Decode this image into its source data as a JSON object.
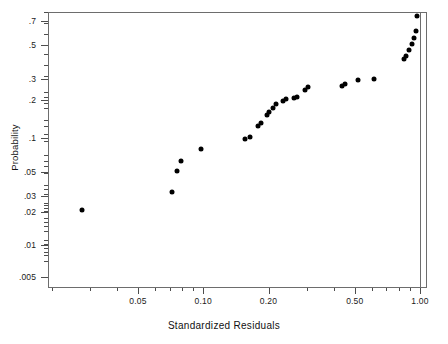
{
  "chart_data": {
    "type": "scatter",
    "title": "",
    "xlabel": "Standardized Residuals",
    "ylabel": "Probability",
    "xscale": "log",
    "yscale": "probability-log",
    "xlim": [
      0.004,
      1.08
    ],
    "ylim": [
      0.004,
      0.78
    ],
    "grid": false,
    "legend": null,
    "x_tick_labels": [
      "0.05",
      "0.10",
      "0.20",
      "0.50",
      "1.00"
    ],
    "x_tick_values": [
      0.05,
      0.1,
      0.2,
      0.5,
      1.0
    ],
    "y_tick_labels": [
      ".7",
      ".5",
      ".3",
      ".2",
      ".1",
      ".05",
      ".03",
      ".02",
      ".01",
      ".005"
    ],
    "y_tick_values": [
      0.7,
      0.5,
      0.3,
      0.2,
      0.1,
      0.05,
      0.03,
      0.02,
      0.01,
      0.005
    ],
    "points": [
      {
        "x": 0.0062,
        "y": 0.0079
      },
      {
        "x": 0.0275,
        "y": 0.0225
      },
      {
        "x": 0.0715,
        "y": 0.0375
      },
      {
        "x": 0.076,
        "y": 0.063
      },
      {
        "x": 0.0785,
        "y": 0.079
      },
      {
        "x": 0.098,
        "y": 0.103
      },
      {
        "x": 0.156,
        "y": 0.125
      },
      {
        "x": 0.164,
        "y": 0.132
      },
      {
        "x": 0.179,
        "y": 0.16
      },
      {
        "x": 0.185,
        "y": 0.17
      },
      {
        "x": 0.196,
        "y": 0.195
      },
      {
        "x": 0.202,
        "y": 0.205
      },
      {
        "x": 0.209,
        "y": 0.22
      },
      {
        "x": 0.217,
        "y": 0.235
      },
      {
        "x": 0.234,
        "y": 0.245
      },
      {
        "x": 0.242,
        "y": 0.252
      },
      {
        "x": 0.262,
        "y": 0.256
      },
      {
        "x": 0.27,
        "y": 0.262
      },
      {
        "x": 0.295,
        "y": 0.29
      },
      {
        "x": 0.305,
        "y": 0.3
      },
      {
        "x": 0.435,
        "y": 0.305
      },
      {
        "x": 0.45,
        "y": 0.315
      },
      {
        "x": 0.515,
        "y": 0.33
      },
      {
        "x": 0.61,
        "y": 0.335
      },
      {
        "x": 0.84,
        "y": 0.43
      },
      {
        "x": 0.86,
        "y": 0.44
      },
      {
        "x": 0.89,
        "y": 0.47
      },
      {
        "x": 0.92,
        "y": 0.5
      },
      {
        "x": 0.94,
        "y": 0.53
      },
      {
        "x": 0.955,
        "y": 0.56
      },
      {
        "x": 0.97,
        "y": 0.63
      }
    ]
  },
  "axes": {
    "y_title": "Probability",
    "x_title": "Standardized Residuals"
  },
  "colors": {
    "marker": "#000000",
    "frame": "#6d6d6d",
    "text": "#1a1a1a",
    "background": "#ffffff"
  }
}
